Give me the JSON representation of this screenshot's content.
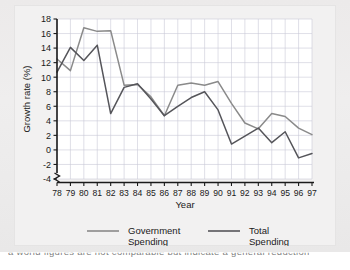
{
  "figure": {
    "background_color": "#eceaea",
    "plate_color": "#f2f1f1",
    "plot_background": "#ffffff",
    "grid_color": "#c9c9d6",
    "axis_color": "#1a1a1a"
  },
  "bottom_strip": {
    "clipped_text": "a world figures are not comparable but indicate a general reduction"
  },
  "chart_data": {
    "type": "line",
    "title": "",
    "xlabel": "Year",
    "ylabel": "Growth rate (%)",
    "x": [
      "78",
      "79",
      "80",
      "81",
      "82",
      "83",
      "84",
      "85",
      "86",
      "87",
      "88",
      "89",
      "90",
      "91",
      "92",
      "93",
      "94",
      "95",
      "96",
      "97"
    ],
    "xlim": [
      0,
      19
    ],
    "ylim": [
      -4,
      18
    ],
    "yticks": [
      -4,
      -2,
      0,
      2,
      4,
      6,
      8,
      10,
      12,
      14,
      16,
      18
    ],
    "ytick_labels": [
      "-4",
      "-2",
      "0",
      "2",
      "4",
      "6",
      "8",
      "10",
      "12",
      "14",
      "16",
      "18"
    ],
    "grid": true,
    "grid_axis": "both",
    "axis_break": true,
    "legend_position": "bottom",
    "series": [
      {
        "name": "Government Spending",
        "color": "#8a8a8a",
        "values": [
          12.5,
          10.9,
          16.8,
          16.3,
          16.4,
          8.9,
          9.0,
          7.3,
          4.7,
          8.9,
          9.2,
          8.9,
          9.4,
          6.4,
          3.7,
          2.9,
          5.0,
          4.6,
          3.0,
          2.1
        ]
      },
      {
        "name": "Total Spending",
        "color": "#55555a",
        "values": [
          10.7,
          14.1,
          12.3,
          14.4,
          5.0,
          8.6,
          9.1,
          7.0,
          4.7,
          6.0,
          7.2,
          8.0,
          5.5,
          0.8,
          1.9,
          3.0,
          1.0,
          2.5,
          -1.1,
          -0.5
        ]
      }
    ]
  },
  "legend": {
    "items": [
      {
        "label_line1": "Government",
        "label_line2": "Spending",
        "color": "#8a8a8a"
      },
      {
        "label_line1": "Total",
        "label_line2": "Spending",
        "color": "#55555a"
      }
    ]
  }
}
